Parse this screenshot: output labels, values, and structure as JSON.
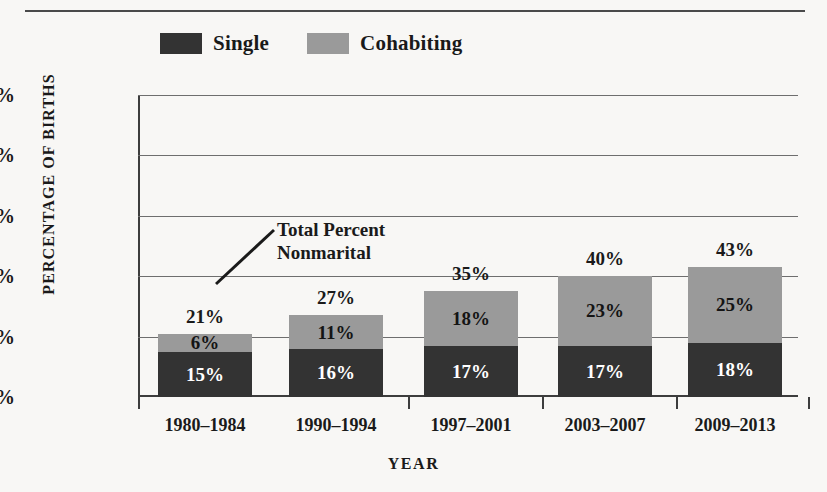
{
  "figure": {
    "top_rule": true
  },
  "legend": {
    "items": [
      {
        "label": "Single",
        "color": "#333333",
        "icon": "legend-swatch-icon"
      },
      {
        "label": "Cohabiting",
        "color": "#9a9a9a",
        "icon": "legend-swatch-icon"
      }
    ]
  },
  "annotation": {
    "text": "Total Percent\nNonmarital"
  },
  "axes": {
    "y_title": "PERCENTAGE OF BIRTHS",
    "x_title": "YEAR",
    "y_ticks": [
      "0%",
      "20%",
      "40%",
      "60%",
      "80%",
      "100%"
    ]
  },
  "chart_data": {
    "type": "bar",
    "subtype": "stacked",
    "title": "",
    "xlabel": "YEAR",
    "ylabel": "PERCENTAGE OF BIRTHS",
    "ylim": [
      0,
      100
    ],
    "ytick_values": [
      0,
      20,
      40,
      60,
      80,
      100
    ],
    "ytick_labels": [
      "0%",
      "20%",
      "40%",
      "60%",
      "80%",
      "100%"
    ],
    "grid": true,
    "legend_position": "top-left",
    "categories": [
      "1980–1984",
      "1990–1994",
      "1997–2001",
      "2003–2007",
      "2009–2013"
    ],
    "series": [
      {
        "name": "Single",
        "color": "#333333",
        "values": [
          15,
          16,
          17,
          17,
          18
        ],
        "labels": [
          "15%",
          "16%",
          "17%",
          "17%",
          "18%"
        ]
      },
      {
        "name": "Cohabiting",
        "color": "#9a9a9a",
        "values": [
          6,
          11,
          18,
          23,
          25
        ],
        "labels": [
          "6%",
          "11%",
          "18%",
          "23%",
          "25%"
        ]
      }
    ],
    "totals": [
      21,
      27,
      35,
      40,
      43
    ],
    "total_labels": [
      "21%",
      "27%",
      "35%",
      "40%",
      "43%"
    ],
    "annotations": [
      {
        "text": "Total Percent Nonmarital",
        "points_to": "total-label"
      }
    ]
  }
}
